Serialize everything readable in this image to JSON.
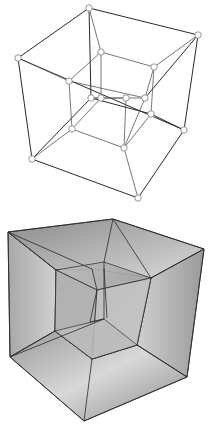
{
  "figures": [
    {
      "name": "tesseract-wireframe",
      "description": "Wireframe projection of a 4D hypercube with circular vertex markers",
      "vertex_marker_color": "#ffffff",
      "edge_color": "#2a2a2a"
    },
    {
      "name": "tesseract-shaded",
      "description": "Shaded projection of a 4D hypercube with gray gradient faces",
      "face_color_light": "#e6e6e6",
      "face_color_dark": "#7a7a7a"
    }
  ]
}
